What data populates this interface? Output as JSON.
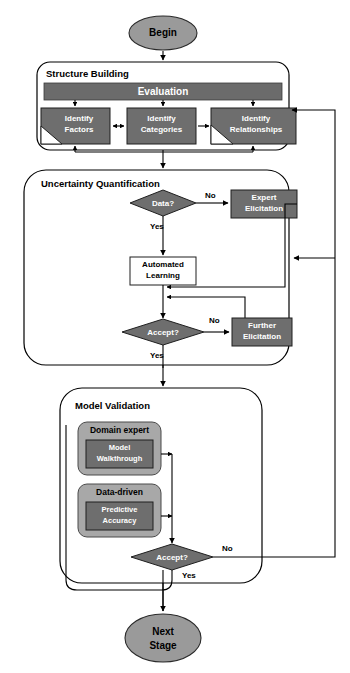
{
  "diagram": {
    "colors": {
      "terminal_fill": "#9a9a9a",
      "bar_fill": "#6b6b6b",
      "process_fill": "#6e6e6e",
      "decision_fill": "#6e6e6e",
      "white_fill": "#ffffff",
      "validation_outer_fill": "#a8a8a8",
      "validation_inner_fill": "#6e6e6e",
      "stroke": "#000000",
      "label_light": "#ffffff",
      "label_dark": "#000000"
    },
    "terminals": {
      "begin": "Begin",
      "next_stage_line1": "Next",
      "next_stage_line2": "Stage"
    },
    "groups": [
      {
        "id": "structure-building",
        "title": "Structure Building"
      },
      {
        "id": "uncertainty-quantification",
        "title": "Uncertainty Quantification"
      },
      {
        "id": "model-validation",
        "title": "Model Validation"
      }
    ],
    "structure_building": {
      "evaluation_bar": "Evaluation",
      "tasks": [
        {
          "id": "identify-factors",
          "line1": "Identify",
          "line2": "Factors",
          "corner_cut": true
        },
        {
          "id": "identify-categories",
          "line1": "Identify",
          "line2": "Categories",
          "corner_cut": false
        },
        {
          "id": "identify-relationships",
          "line1": "Identify",
          "line2": "Relationships",
          "corner_cut": true
        }
      ]
    },
    "uncertainty_quantification": {
      "data_decision": "Data?",
      "expert_elicitation_line1": "Expert",
      "expert_elicitation_line2": "Elicitation",
      "automated_learning_line1": "Automated",
      "automated_learning_line2": "Learning",
      "accept_decision": "Accept?",
      "further_elicitation_line1": "Further",
      "further_elicitation_line2": "Elicitation"
    },
    "model_validation": {
      "domain_expert": {
        "label": "Domain expert",
        "inner_line1": "Model",
        "inner_line2": "Walkthrough"
      },
      "data_driven": {
        "label": "Data-driven",
        "inner_line1": "Predictive",
        "inner_line2": "Accuracy"
      },
      "accept_decision": "Accept?"
    },
    "edge_labels": {
      "data_no": "No",
      "data_yes": "Yes",
      "uq_accept_no": "No",
      "uq_accept_yes": "Yes",
      "mv_accept_no": "No",
      "mv_accept_yes": "Yes"
    }
  }
}
